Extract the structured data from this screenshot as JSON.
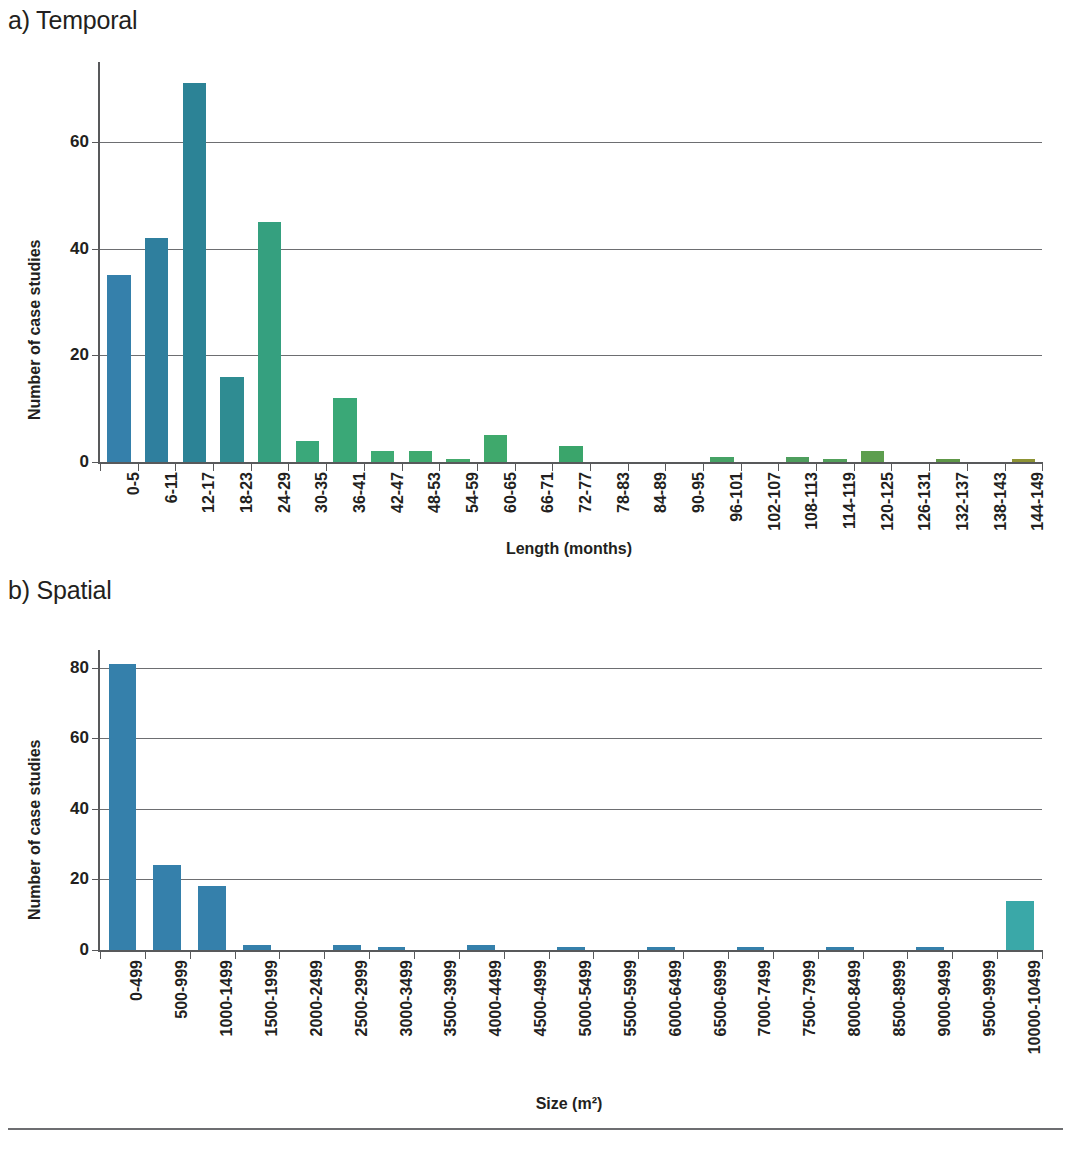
{
  "figure": {
    "panel_a_label": "a) Temporal",
    "panel_b_label": "b) Spatial"
  },
  "chart_data": [
    {
      "type": "bar",
      "id": "temporal",
      "title": "a) Temporal",
      "xlabel": "Length (months)",
      "ylabel": "Number of case studies",
      "ylim": [
        0,
        75
      ],
      "yticks": [
        0,
        20,
        40,
        60
      ],
      "grid": true,
      "legend": "none",
      "categories": [
        "0-5",
        "6-11",
        "12-17",
        "18-23",
        "24-29",
        "30-35",
        "36-41",
        "42-47",
        "48-53",
        "54-59",
        "60-65",
        "66-71",
        "72-77",
        "78-83",
        "84-89",
        "90-95",
        "96-101",
        "102-107",
        "108-113",
        "114-119",
        "120-125",
        "126-131",
        "132-137",
        "138-143",
        "144-149"
      ],
      "values": [
        35,
        42,
        71,
        16,
        45,
        4,
        12,
        2,
        2,
        0.5,
        5,
        0,
        3,
        0,
        0,
        0,
        1,
        0,
        1,
        0.5,
        2,
        0,
        0.5,
        0,
        0.5
      ],
      "colors": [
        "#3580ab",
        "#2f7f9e",
        "#2c8396",
        "#2f8c92",
        "#35a07f",
        "#3aa87a",
        "#3aa877",
        "#3fab74",
        "#3fa96f",
        "#44a96c",
        "#3fa96c",
        "#44a96a",
        "#3aa56b",
        "#49a869",
        "#4fa967",
        "#57a862",
        "#46a265",
        "#5aa75f",
        "#4e9e5d",
        "#52a05b",
        "#5d9e4e",
        "#6f9f4b",
        "#5e9747",
        "#7d9a3f",
        "#8d9334"
      ]
    },
    {
      "type": "bar",
      "id": "spatial",
      "title": "b) Spatial",
      "xlabel": "Size (m²)",
      "ylabel": "Number of case studies",
      "ylim": [
        0,
        85
      ],
      "yticks": [
        0,
        20,
        40,
        60,
        80
      ],
      "grid": true,
      "legend": "none",
      "categories": [
        "0-499",
        "500-999",
        "1000-1499",
        "1500-1999",
        "2000-2499",
        "2500-2999",
        "3000-3499",
        "3500-3999",
        "4000-4499",
        "4500-4999",
        "5000-5499",
        "5500-5999",
        "6000-6499",
        "6500-6999",
        "7000-7499",
        "7500-7999",
        "8000-8499",
        "8500-8999",
        "9000-9499",
        "9500-9999",
        "10000-10499"
      ],
      "values": [
        81,
        24,
        18,
        1.5,
        0,
        1.5,
        0.8,
        0,
        1.5,
        0,
        0.8,
        0,
        0.8,
        0,
        0.8,
        0,
        0.8,
        0,
        0.8,
        0,
        14
      ],
      "colors": [
        "#3580ab",
        "#3580ab",
        "#3580ab",
        "#3580ab",
        "#3580ab",
        "#3580ab",
        "#3580ab",
        "#3580ab",
        "#3580ab",
        "#3580ab",
        "#3580ab",
        "#3580ab",
        "#3580ab",
        "#3580ab",
        "#3580ab",
        "#3580ab",
        "#3580ab",
        "#3580ab",
        "#3580ab",
        "#3580ab",
        "#3aa8a8"
      ]
    }
  ]
}
